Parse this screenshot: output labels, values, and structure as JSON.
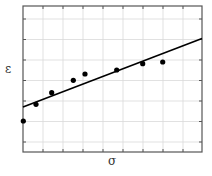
{
  "chart_data": {
    "type": "scatter",
    "title": "",
    "xlabel": "σ",
    "ylabel": "ε",
    "x_tick_labels": [],
    "y_tick_labels": [],
    "grid": true,
    "legend": null,
    "units_note": "No numeric axis values shown; coordinates expressed in grid units from the lower-left corner of the plot frame (x: 0–9, y: 0–7.1).",
    "xlim": [
      0,
      9
    ],
    "ylim": [
      0,
      7.1
    ],
    "series": [
      {
        "name": "measured points",
        "kind": "scatter",
        "marker": "filled-circle",
        "color": "#000000",
        "x": [
          0.0,
          0.65,
          1.45,
          2.53,
          3.12,
          4.71,
          6.0,
          7.0
        ],
        "y": [
          1.51,
          2.33,
          2.9,
          3.5,
          3.81,
          3.99,
          4.3,
          4.38
        ]
      },
      {
        "name": "linear fit",
        "kind": "line",
        "color": "#000000",
        "x": [
          0,
          9
        ],
        "y": [
          2.2,
          5.53
        ]
      }
    ]
  },
  "render": {
    "frame": {
      "left": 23,
      "top": 6,
      "right": 202,
      "bottom": 152
    },
    "frame_color": "#555555",
    "grid_color": "#d9d9d9",
    "x_grid": [
      43,
      63,
      83,
      103,
      123,
      143,
      163,
      183
    ],
    "y_grid": [
      19,
      39.5,
      60,
      80.5,
      101,
      121.5,
      142
    ],
    "points_px": [
      [
        23.3,
        121
      ],
      [
        36,
        104.3
      ],
      [
        51.7,
        92.7
      ],
      [
        73.3,
        80.3
      ],
      [
        85,
        74
      ],
      [
        116.7,
        70
      ],
      [
        142.7,
        63.7
      ],
      [
        162.7,
        62
      ]
    ],
    "fit_px": [
      [
        23,
        107
      ],
      [
        202,
        38.5
      ]
    ],
    "point_radius": 2.6
  }
}
